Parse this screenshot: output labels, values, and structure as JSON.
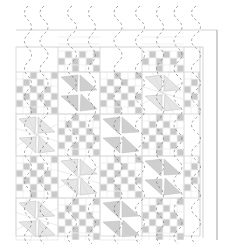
{
  "diagram": {
    "type": "quilt-pattern",
    "colors": {
      "background": "#ffffff",
      "seam": "#d4d4d4",
      "border_line": "#c8c8c8",
      "outer_edge": "#b0b0b0",
      "checker_fill": "#c9c9c9",
      "triangle_fill": "#cfcfcf",
      "triangle_light": "#e6e6e6",
      "quilting_line": "#6e6e6e"
    },
    "layout": {
      "quilt_left": 16,
      "quilt_top": 47,
      "quilt_right": 200,
      "quilt_bottom": 236,
      "border_top_line": 30,
      "outer_right_line_1": 203,
      "outer_right_line_2": 217,
      "block_size": 42,
      "row_tops": [
        30,
        72,
        114,
        156,
        198
      ],
      "col_lefts": [
        16,
        58,
        100,
        142,
        184
      ]
    },
    "blocks": [
      {
        "row": 1,
        "col": 0,
        "kind": "checker"
      },
      {
        "row": 1,
        "col": 1,
        "kind": "pinwheel-dark"
      },
      {
        "row": 1,
        "col": 2,
        "kind": "checker"
      },
      {
        "row": 1,
        "col": 3,
        "kind": "pinwheel-light"
      },
      {
        "row": 1,
        "col": 4,
        "kind": "checker-partial"
      },
      {
        "row": 2,
        "col": 0,
        "kind": "pinwheel-light"
      },
      {
        "row": 2,
        "col": 1,
        "kind": "checker"
      },
      {
        "row": 2,
        "col": 2,
        "kind": "pinwheel-dark"
      },
      {
        "row": 2,
        "col": 3,
        "kind": "checker"
      },
      {
        "row": 2,
        "col": 4,
        "kind": "plain-partial"
      },
      {
        "row": 3,
        "col": 0,
        "kind": "checker"
      },
      {
        "row": 3,
        "col": 1,
        "kind": "pinwheel-light"
      },
      {
        "row": 3,
        "col": 2,
        "kind": "checker"
      },
      {
        "row": 3,
        "col": 3,
        "kind": "pinwheel-dark"
      },
      {
        "row": 3,
        "col": 4,
        "kind": "checker-partial"
      },
      {
        "row": 4,
        "col": 0,
        "kind": "pinwheel-light"
      },
      {
        "row": 4,
        "col": 1,
        "kind": "checker"
      },
      {
        "row": 4,
        "col": 2,
        "kind": "pinwheel-dark"
      },
      {
        "row": 4,
        "col": 3,
        "kind": "checker"
      },
      {
        "row": 4,
        "col": 4,
        "kind": "plain-partial"
      },
      {
        "row": 0,
        "col": 1,
        "kind": "checker-top-partial"
      },
      {
        "row": 0,
        "col": 3,
        "kind": "checker-top-partial"
      }
    ],
    "quilting_lines_x": [
      28,
      44,
      72,
      92,
      118,
      140,
      160,
      178,
      196
    ]
  }
}
